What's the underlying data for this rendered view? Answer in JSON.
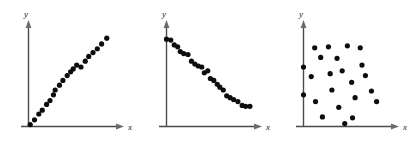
{
  "figure": {
    "title": "",
    "background_color": "#ffffff",
    "panel_count": 3,
    "axis_color": "#4a4a4a",
    "dot_color": "#0d0d0d",
    "dot_radius": 2.6
  },
  "chart_data": [
    {
      "type": "scatter",
      "title": "",
      "name": "positive-linear-correlation",
      "xlabel": "x",
      "ylabel": "y",
      "grid": false,
      "legend": "none",
      "xlim": [
        0,
        100
      ],
      "ylim": [
        0,
        100
      ],
      "points": [
        [
          2,
          2
        ],
        [
          7,
          7
        ],
        [
          12,
          13
        ],
        [
          16,
          17
        ],
        [
          21,
          23
        ],
        [
          25,
          27
        ],
        [
          29,
          33
        ],
        [
          31,
          38
        ],
        [
          36,
          43
        ],
        [
          40,
          48
        ],
        [
          45,
          53
        ],
        [
          49,
          57
        ],
        [
          52,
          60
        ],
        [
          56,
          64
        ],
        [
          61,
          62
        ],
        [
          66,
          68
        ],
        [
          70,
          73
        ],
        [
          75,
          77
        ],
        [
          80,
          81
        ],
        [
          85,
          86
        ],
        [
          91,
          92
        ]
      ]
    },
    {
      "type": "scatter",
      "title": "",
      "name": "negative-linear-correlation",
      "xlabel": "x",
      "ylabel": "y",
      "grid": false,
      "legend": "none",
      "xlim": [
        0,
        100
      ],
      "ylim": [
        0,
        100
      ],
      "points": [
        [
          0,
          91
        ],
        [
          5,
          90
        ],
        [
          9,
          85
        ],
        [
          13,
          83
        ],
        [
          16,
          78
        ],
        [
          20,
          76
        ],
        [
          25,
          75
        ],
        [
          29,
          68
        ],
        [
          33,
          65
        ],
        [
          37,
          63
        ],
        [
          41,
          62
        ],
        [
          44,
          56
        ],
        [
          48,
          58
        ],
        [
          51,
          50
        ],
        [
          55,
          48
        ],
        [
          59,
          44
        ],
        [
          62,
          41
        ],
        [
          66,
          38
        ],
        [
          70,
          32
        ],
        [
          74,
          30
        ],
        [
          78,
          28
        ],
        [
          83,
          26
        ],
        [
          88,
          22
        ],
        [
          92,
          21
        ],
        [
          97,
          21
        ]
      ]
    },
    {
      "type": "scatter",
      "title": "",
      "name": "no-correlation",
      "xlabel": "x",
      "ylabel": "y",
      "grid": false,
      "legend": "none",
      "xlim": [
        0,
        100
      ],
      "ylim": [
        0,
        100
      ],
      "points": [
        [
          0,
          62
        ],
        [
          0,
          33
        ],
        [
          9,
          52
        ],
        [
          13,
          82
        ],
        [
          14,
          26
        ],
        [
          20,
          72
        ],
        [
          22,
          10
        ],
        [
          29,
          83
        ],
        [
          31,
          55
        ],
        [
          33,
          38
        ],
        [
          39,
          71
        ],
        [
          41,
          20
        ],
        [
          45,
          58
        ],
        [
          48,
          3
        ],
        [
          51,
          84
        ],
        [
          56,
          46
        ],
        [
          57,
          9
        ],
        [
          60,
          30
        ],
        [
          66,
          82
        ],
        [
          68,
          64
        ],
        [
          72,
          53
        ],
        [
          79,
          37
        ],
        [
          85,
          26
        ]
      ]
    }
  ],
  "panels": [
    {
      "id": "panel-1",
      "axis": {
        "x_label": "x",
        "y_label": "y"
      }
    },
    {
      "id": "panel-2",
      "axis": {
        "x_label": "x",
        "y_label": "y"
      }
    },
    {
      "id": "panel-3",
      "axis": {
        "x_label": "x",
        "y_label": "y"
      }
    }
  ]
}
